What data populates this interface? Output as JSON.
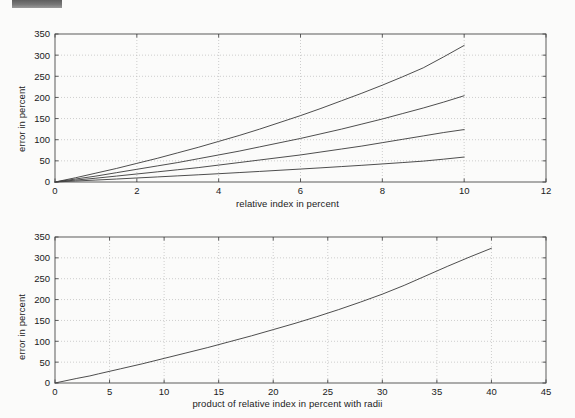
{
  "page": {
    "background_color": "#fbfbfa",
    "redaction_bar": {
      "name": "redaction-bar",
      "color": "#6e6e6e"
    }
  },
  "chart_data": [
    {
      "id": "top",
      "type": "line",
      "title": "",
      "xlabel": "relative index in percent",
      "ylabel": "error in percent",
      "xlim": [
        0,
        12
      ],
      "ylim": [
        0,
        350
      ],
      "xticks": [
        0,
        2,
        4,
        6,
        8,
        10,
        12
      ],
      "yticks": [
        0,
        50,
        100,
        150,
        200,
        250,
        300,
        350
      ],
      "grid": true,
      "grid_style": "dotted",
      "legend": "none",
      "line_color": "#3a3a3a",
      "series": [
        {
          "name": "curve-1",
          "x": [
            0,
            0.5,
            1,
            1.5,
            2,
            2.5,
            3,
            3.5,
            4,
            4.5,
            5,
            5.5,
            6,
            6.5,
            7,
            7.5,
            8,
            8.5,
            9,
            9.5,
            10
          ],
          "y": [
            0,
            10,
            21,
            32,
            44,
            56,
            69,
            82,
            96,
            110,
            125,
            141,
            157,
            174,
            192,
            210,
            229,
            249,
            270,
            296,
            323
          ]
        },
        {
          "name": "curve-2",
          "x": [
            0,
            0.5,
            1,
            1.5,
            2,
            2.5,
            3,
            3.5,
            4,
            4.5,
            5,
            5.5,
            6,
            6.5,
            7,
            7.5,
            8,
            8.5,
            9,
            9.5,
            10
          ],
          "y": [
            0,
            7,
            14,
            22,
            30,
            38,
            46,
            55,
            64,
            73,
            83,
            93,
            103,
            114,
            125,
            137,
            149,
            162,
            175,
            189,
            204
          ]
        },
        {
          "name": "curve-3",
          "x": [
            0,
            0.5,
            1,
            1.5,
            2,
            2.5,
            3,
            3.5,
            4,
            4.5,
            5,
            5.5,
            6,
            6.5,
            7,
            7.5,
            8,
            8.5,
            9,
            9.5,
            10
          ],
          "y": [
            0,
            4.5,
            9,
            14,
            19,
            24,
            29,
            34,
            40,
            46,
            52,
            58,
            64,
            71,
            78,
            85,
            93,
            101,
            109,
            117,
            124
          ]
        },
        {
          "name": "curve-4",
          "x": [
            0,
            0.5,
            1,
            1.5,
            2,
            2.5,
            3,
            3.5,
            4,
            4.5,
            5,
            5.5,
            6,
            6.5,
            7,
            7.5,
            8,
            8.5,
            9,
            9.5,
            10
          ],
          "y": [
            0,
            2.3,
            4.6,
            7,
            9.5,
            12,
            14.5,
            17,
            19.6,
            22.3,
            25,
            27.8,
            30.6,
            33.5,
            36.5,
            39.5,
            42.7,
            46,
            49.4,
            54,
            59
          ]
        }
      ]
    },
    {
      "id": "bottom",
      "type": "line",
      "title": "",
      "xlabel": "product of relative index in percent with radii",
      "ylabel": "error in percent",
      "xlim": [
        0,
        45
      ],
      "ylim": [
        0,
        350
      ],
      "xticks": [
        0,
        5,
        10,
        15,
        20,
        25,
        30,
        35,
        40,
        45
      ],
      "yticks": [
        0,
        50,
        100,
        150,
        200,
        250,
        300,
        350
      ],
      "grid": true,
      "grid_style": "dotted",
      "legend": "none",
      "line_color": "#3a3a3a",
      "series": [
        {
          "name": "collapsed-curve",
          "x": [
            0,
            2,
            3.2,
            4,
            6,
            8,
            10,
            12,
            14,
            16,
            18,
            20,
            22,
            24,
            26,
            28,
            30,
            32,
            34,
            36,
            38,
            40
          ],
          "y": [
            0,
            11,
            17,
            22,
            34,
            46,
            59,
            72,
            85,
            99,
            113,
            128,
            143,
            159,
            176,
            194,
            213,
            234,
            257,
            280,
            302,
            323
          ]
        }
      ]
    }
  ]
}
